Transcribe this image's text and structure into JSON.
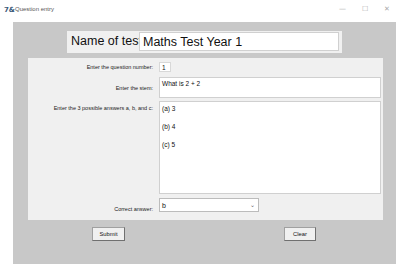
{
  "window": {
    "title": "Question entry",
    "app_icon": "7&",
    "controls": {
      "minimize": "—",
      "maximize": "☐",
      "close": "✕"
    }
  },
  "header": {
    "label": "Name of test",
    "test_name_value": "Maths Test Year 1"
  },
  "form": {
    "question_number": {
      "label": "Enter the question number:",
      "value": "1"
    },
    "stem": {
      "label": "Enter the stem:",
      "value": "What is 2 + 2"
    },
    "answers": {
      "label": "Enter the 3 possible answers a, b, and c:",
      "lines": [
        "(a)  3",
        "(b)  4",
        "(c)  5"
      ]
    },
    "correct_answer": {
      "label": "Correct answer:",
      "value": "b",
      "chevron": "⌄"
    }
  },
  "buttons": {
    "submit": "Submit",
    "clear": "Clear"
  }
}
